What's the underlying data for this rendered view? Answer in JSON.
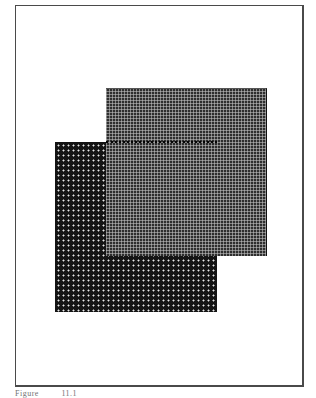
{
  "figure": {
    "shapes": [
      {
        "name": "back-square",
        "pattern": "white dots on black",
        "fill": "#141414"
      },
      {
        "name": "front-square",
        "pattern": "fine light grid on dark gray",
        "fill": "#2e2e2e"
      },
      {
        "name": "hidden-edge",
        "style": "dotted line",
        "color": "#050505"
      }
    ],
    "frame_color": "#4a4a4a"
  },
  "caption": {
    "label": "Figure",
    "number": "11.1"
  }
}
